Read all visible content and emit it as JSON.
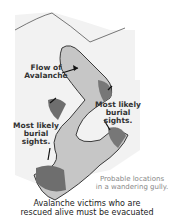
{
  "diagram": {
    "labels": {
      "flow": "Flow of Avalanche",
      "flow_line1": "Flow of",
      "flow_line2": "Avalanche",
      "burial_right_line1": "Most likely",
      "burial_right_line2": "burial sights.",
      "burial_left_line1": "Most likely",
      "burial_left_line2": "burial sights.",
      "probable_line1": "Probable locations",
      "probable_line2": "in a wandering gully."
    },
    "caption": {
      "line1": "Avalanche victims who are",
      "line2": "rescued alive must be evacuated"
    },
    "colors": {
      "snow": "#f2f2f2",
      "gully": "#b9b9b9",
      "debris": "#6e6e6e",
      "outline": "#3a3a3a"
    }
  }
}
